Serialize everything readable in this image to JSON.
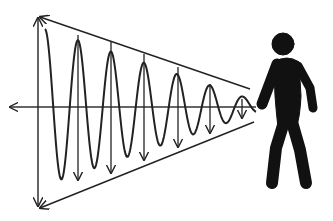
{
  "diagram": {
    "colors": {
      "background": "#ffffff",
      "stroke": "#222222",
      "figure": "#111111"
    },
    "axis": {
      "y": 107,
      "x_start": 10,
      "x_end": 256
    },
    "amplitude_arrow": {
      "x": 38,
      "y_top": 18,
      "y_bottom": 206
    },
    "envelope": {
      "top": {
        "x1": 40,
        "y1": 17,
        "x2": 250,
        "y2": 89
      },
      "bottom": {
        "x1": 40,
        "y1": 208,
        "x2": 254,
        "y2": 122
      }
    },
    "wave": {
      "x_start": 45,
      "x_end": 256,
      "period": 33,
      "first_peak_x": 78,
      "start_amplitude": 78,
      "end_amplitude": 6
    },
    "peak_arrows": [
      {
        "x": 78,
        "top": 35,
        "bottom": 180
      },
      {
        "x": 111,
        "top": 42,
        "bottom": 173
      },
      {
        "x": 144,
        "top": 54,
        "bottom": 160
      },
      {
        "x": 178,
        "top": 67,
        "bottom": 147
      },
      {
        "x": 210,
        "top": 84,
        "bottom": 133
      },
      {
        "x": 242,
        "top": 99,
        "bottom": 118
      }
    ],
    "figure": {
      "label": "person",
      "head": {
        "cx": 283,
        "cy": 44,
        "r": 11
      }
    }
  }
}
